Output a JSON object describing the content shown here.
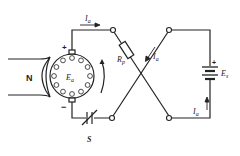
{
  "diagram": {
    "type": "circuit",
    "labels": {
      "magnet_pole": "N",
      "armature_emf": {
        "main": "E",
        "sub": "a"
      },
      "series_resistor": {
        "main": "R",
        "sub": "p"
      },
      "battery": {
        "main": "E",
        "sub": "s"
      },
      "switch": "S",
      "current_top": {
        "main": "I",
        "sub": "a"
      },
      "current_cross": {
        "main": "I",
        "sub": "a"
      },
      "current_right": {
        "main": "I",
        "sub": "a"
      },
      "brush_top_polarity": "+",
      "brush_bottom_polarity": "−",
      "battery_polarity": "+"
    },
    "colors": {
      "line": "#222222",
      "background": "#ffffff"
    }
  }
}
